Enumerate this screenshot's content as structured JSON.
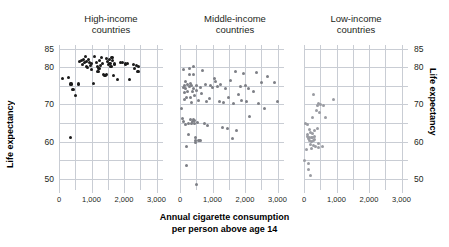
{
  "chart_data": {
    "type": "scatter",
    "title": "",
    "xlabel": "Annual cigarette consumption\nper person above age 14",
    "ylabel": "Life expectancy",
    "ylabel_right": "Life expectancy",
    "xlim": [
      0,
      3200
    ],
    "ylim": [
      47,
      86
    ],
    "grid": true,
    "xticks": [
      0,
      1000,
      2000,
      3000
    ],
    "xtick_labels": [
      "0",
      "1,000",
      "2,000",
      "3,000"
    ],
    "yticks": [
      50,
      60,
      70,
      80,
      85
    ],
    "ytick_labels": [
      "50",
      "60",
      "70",
      "80",
      "85"
    ],
    "ygrid_values": [
      50,
      55,
      60,
      65,
      70,
      75,
      80,
      85
    ],
    "legend": "none",
    "panels": [
      {
        "id": "high-income",
        "title": "High-income\ncountries",
        "color": "#1a1a1a",
        "points": [
          [
            120,
            77.0
          ],
          [
            300,
            77.2
          ],
          [
            360,
            61.0
          ],
          [
            370,
            75.5
          ],
          [
            430,
            74.0
          ],
          [
            520,
            72.5
          ],
          [
            600,
            75.5
          ],
          [
            640,
            81.5
          ],
          [
            700,
            81.8
          ],
          [
            720,
            80.8
          ],
          [
            760,
            82.0
          ],
          [
            790,
            81.2
          ],
          [
            820,
            82.8
          ],
          [
            840,
            81.5
          ],
          [
            860,
            80.2
          ],
          [
            880,
            79.9
          ],
          [
            900,
            82.1
          ],
          [
            930,
            81.4
          ],
          [
            960,
            80.6
          ],
          [
            990,
            79.4
          ],
          [
            1010,
            81.0
          ],
          [
            1060,
            75.7
          ],
          [
            1100,
            82.9
          ],
          [
            1140,
            81.3
          ],
          [
            1180,
            80.2
          ],
          [
            1200,
            78.9
          ],
          [
            1230,
            79.6
          ],
          [
            1260,
            81.9
          ],
          [
            1290,
            80.5
          ],
          [
            1310,
            82.6
          ],
          [
            1340,
            81.0
          ],
          [
            1360,
            78.0
          ],
          [
            1390,
            77.9
          ],
          [
            1420,
            77.9
          ],
          [
            1450,
            78.0
          ],
          [
            1470,
            82.4
          ],
          [
            1490,
            81.6
          ],
          [
            1510,
            80.8
          ],
          [
            1540,
            82.0
          ],
          [
            1570,
            81.1
          ],
          [
            1600,
            80.3
          ],
          [
            1630,
            82.7
          ],
          [
            1660,
            81.8
          ],
          [
            1690,
            77.8
          ],
          [
            1720,
            80.9
          ],
          [
            1800,
            76.8
          ],
          [
            1900,
            81.3
          ],
          [
            1960,
            81.2
          ],
          [
            2050,
            80.9
          ],
          [
            2100,
            81.0
          ],
          [
            2180,
            76.8
          ],
          [
            2280,
            80.8
          ],
          [
            2330,
            79.7
          ],
          [
            2380,
            80.5
          ],
          [
            2430,
            78.9
          ],
          [
            2460,
            80.3
          ]
        ]
      },
      {
        "id": "middle-income",
        "title": "Middle-income\ncountries",
        "color": "#7d7f86",
        "points": [
          [
            60,
            69.0
          ],
          [
            80,
            66.2
          ],
          [
            100,
            65.4
          ],
          [
            110,
            74.6
          ],
          [
            120,
            79.5
          ],
          [
            130,
            73.1
          ],
          [
            140,
            75.2
          ],
          [
            150,
            71.3
          ],
          [
            160,
            64.7
          ],
          [
            170,
            76.2
          ],
          [
            180,
            74.3
          ],
          [
            190,
            72.0
          ],
          [
            200,
            53.6
          ],
          [
            210,
            58.8
          ],
          [
            230,
            75.4
          ],
          [
            240,
            73.4
          ],
          [
            250,
            62.0
          ],
          [
            260,
            65.0
          ],
          [
            280,
            79.8
          ],
          [
            290,
            78.2
          ],
          [
            300,
            74.9
          ],
          [
            310,
            71.8
          ],
          [
            320,
            75.6
          ],
          [
            330,
            66.0
          ],
          [
            340,
            64.8
          ],
          [
            350,
            70.5
          ],
          [
            360,
            75.1
          ],
          [
            380,
            73.6
          ],
          [
            390,
            65.3
          ],
          [
            400,
            66.0
          ],
          [
            410,
            80.3
          ],
          [
            420,
            78.0
          ],
          [
            430,
            74.2
          ],
          [
            440,
            72.4
          ],
          [
            450,
            65.6
          ],
          [
            460,
            64.9
          ],
          [
            470,
            61.0
          ],
          [
            480,
            60.2
          ],
          [
            490,
            59.8
          ],
          [
            500,
            48.6
          ],
          [
            510,
            75.0
          ],
          [
            520,
            73.8
          ],
          [
            540,
            65.1
          ],
          [
            560,
            71.0
          ],
          [
            580,
            60.3
          ],
          [
            600,
            60.2
          ],
          [
            620,
            60.3
          ],
          [
            640,
            74.7
          ],
          [
            660,
            73.0
          ],
          [
            700,
            79.2
          ],
          [
            740,
            65.0
          ],
          [
            780,
            75.3
          ],
          [
            820,
            70.9
          ],
          [
            860,
            64.4
          ],
          [
            900,
            71.5
          ],
          [
            950,
            75.0
          ],
          [
            1000,
            74.6
          ],
          [
            1050,
            77.0
          ],
          [
            1100,
            76.3
          ],
          [
            1150,
            74.9
          ],
          [
            1200,
            70.8
          ],
          [
            1250,
            75.4
          ],
          [
            1300,
            63.8
          ],
          [
            1350,
            70.6
          ],
          [
            1400,
            74.4
          ],
          [
            1450,
            63.5
          ],
          [
            1500,
            72.0
          ],
          [
            1550,
            76.4
          ],
          [
            1600,
            60.8
          ],
          [
            1650,
            70.2
          ],
          [
            1700,
            78.9
          ],
          [
            1750,
            63.0
          ],
          [
            1800,
            72.6
          ],
          [
            1850,
            74.8
          ],
          [
            1900,
            71.0
          ],
          [
            1950,
            78.3
          ],
          [
            2000,
            75.1
          ],
          [
            2050,
            70.8
          ],
          [
            2100,
            74.3
          ],
          [
            2150,
            66.9
          ],
          [
            2250,
            73.4
          ],
          [
            2350,
            78.6
          ],
          [
            2400,
            70.2
          ],
          [
            2500,
            76.0
          ],
          [
            2600,
            68.8
          ],
          [
            2700,
            77.4
          ],
          [
            2900,
            76.0
          ],
          [
            3000,
            70.8
          ]
        ]
      },
      {
        "id": "low-income",
        "title": "Low-income\ncountries",
        "color": "#9a9ca2",
        "points": [
          [
            30,
            55.0
          ],
          [
            60,
            64.9
          ],
          [
            80,
            57.8
          ],
          [
            100,
            64.7
          ],
          [
            110,
            62.0
          ],
          [
            120,
            61.5
          ],
          [
            130,
            60.8
          ],
          [
            140,
            54.2
          ],
          [
            150,
            52.6
          ],
          [
            160,
            63.4
          ],
          [
            170,
            61.2
          ],
          [
            180,
            60.4
          ],
          [
            190,
            59.3
          ],
          [
            200,
            51.0
          ],
          [
            210,
            62.4
          ],
          [
            220,
            61.0
          ],
          [
            230,
            60.0
          ],
          [
            240,
            58.2
          ],
          [
            250,
            66.5
          ],
          [
            260,
            62.2
          ],
          [
            270,
            61.1
          ],
          [
            280,
            60.2
          ],
          [
            290,
            59.0
          ],
          [
            300,
            72.6
          ],
          [
            310,
            63.0
          ],
          [
            320,
            61.4
          ],
          [
            330,
            60.6
          ],
          [
            350,
            58.6
          ],
          [
            380,
            68.3
          ],
          [
            400,
            63.5
          ],
          [
            420,
            69.8
          ],
          [
            440,
            70.3
          ],
          [
            450,
            58.4
          ],
          [
            460,
            59.6
          ],
          [
            480,
            67.8
          ],
          [
            520,
            70.0
          ],
          [
            560,
            58.6
          ],
          [
            600,
            69.6
          ],
          [
            650,
            66.4
          ],
          [
            900,
            71.4
          ]
        ]
      }
    ]
  }
}
